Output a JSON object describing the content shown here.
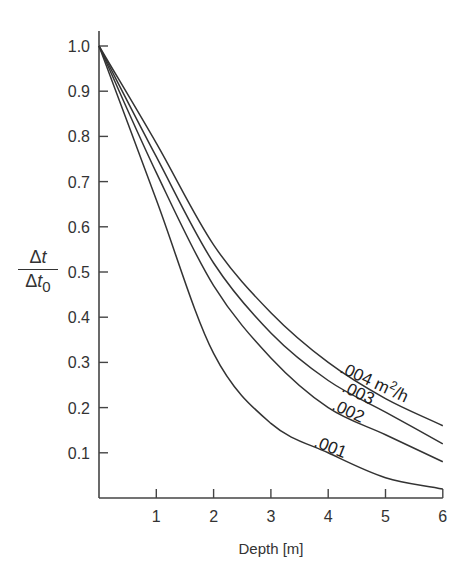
{
  "chart_data": {
    "type": "line",
    "title": "",
    "xlabel": "Depth [m]",
    "ylabel": "Δt / Δt0",
    "ylabel_parts": {
      "numerator_symbol": "Δ",
      "numerator_var": "t",
      "denominator_symbol": "Δ",
      "denominator_var": "t",
      "denominator_sub": "0"
    },
    "xlim": [
      0,
      6
    ],
    "ylim": [
      0,
      1.0
    ],
    "x_ticks": [
      1,
      2,
      3,
      4,
      5,
      6
    ],
    "x_tick_labels": [
      "1",
      "2",
      "3",
      "4",
      "5",
      "6"
    ],
    "y_ticks": [
      0.1,
      0.2,
      0.3,
      0.4,
      0.5,
      0.6,
      0.7,
      0.8,
      0.9,
      1.0
    ],
    "y_tick_labels": [
      "0.1",
      "0.2",
      "0.3",
      "0.4",
      "0.5",
      "0.6",
      "0.7",
      "0.8",
      "0.9",
      "1.0"
    ],
    "grid": false,
    "legend": "inline curve labels",
    "x": [
      0,
      1,
      2,
      3,
      4,
      5,
      6
    ],
    "series": [
      {
        "name": ".004 m²/h",
        "label": ".004 m",
        "label_sup": "2",
        "label_tail": "/h",
        "values": [
          1.0,
          0.785,
          0.56,
          0.41,
          0.3,
          0.22,
          0.16
        ]
      },
      {
        "name": ".003",
        "label": ".003",
        "values": [
          1.0,
          0.755,
          0.52,
          0.365,
          0.26,
          0.19,
          0.12
        ]
      },
      {
        "name": ".002",
        "label": ".002",
        "values": [
          1.0,
          0.72,
          0.47,
          0.31,
          0.2,
          0.14,
          0.08
        ]
      },
      {
        "name": ".001",
        "label": ".001",
        "values": [
          1.0,
          0.66,
          0.32,
          0.165,
          0.1,
          0.045,
          0.02
        ]
      }
    ],
    "colors": {
      "line": "#333333",
      "axis": "#444444",
      "text": "#333333"
    }
  }
}
